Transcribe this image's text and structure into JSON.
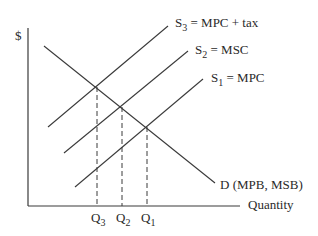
{
  "diagram": {
    "y_axis_label": "$",
    "x_axis_label": "Quantity",
    "curves": {
      "s3": {
        "symbol": "S",
        "sub": "3",
        "rest": " = MPC + tax"
      },
      "s2": {
        "symbol": "S",
        "sub": "2",
        "rest": " = MSC"
      },
      "s1": {
        "symbol": "S",
        "sub": "1",
        "rest": " = MPC"
      },
      "demand": {
        "label": "D (MPB, MSB)"
      }
    },
    "quantities": [
      {
        "symbol": "Q",
        "sub": "3"
      },
      {
        "symbol": "Q",
        "sub": "2"
      },
      {
        "symbol": "Q",
        "sub": "1"
      }
    ],
    "colors": {
      "line": "#3a3a3a",
      "text": "#2a2a2a"
    }
  }
}
